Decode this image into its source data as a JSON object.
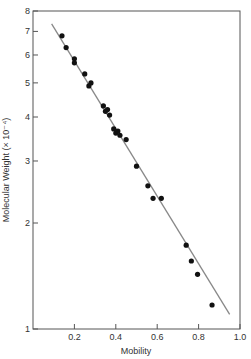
{
  "chart_data": {
    "type": "scatter",
    "title": "",
    "xlabel": "Mobility",
    "ylabel": "Molecular Weight (× 10⁻⁴)",
    "xlim": [
      0.0,
      1.0
    ],
    "ylim": [
      1,
      8
    ],
    "yscale": "log",
    "grid": false,
    "legend": null,
    "x_ticks": [
      0.2,
      0.4,
      0.6,
      0.8,
      1.0
    ],
    "x_tick_labels": [
      "0.2",
      "0.4",
      "0.6",
      "0.8",
      "1.0"
    ],
    "y_ticks": [
      1,
      2,
      3,
      4,
      5,
      6,
      7,
      8
    ],
    "y_tick_labels": [
      "1",
      "2",
      "3",
      "4",
      "5",
      "6",
      "7",
      "8"
    ],
    "series": [
      {
        "name": "Proteins",
        "kind": "points",
        "x": [
          0.14,
          0.16,
          0.2,
          0.2,
          0.25,
          0.27,
          0.28,
          0.34,
          0.35,
          0.36,
          0.37,
          0.39,
          0.4,
          0.41,
          0.42,
          0.45,
          0.5,
          0.555,
          0.58,
          0.62,
          0.74,
          0.765,
          0.795,
          0.865
        ],
        "y": [
          6.8,
          6.3,
          5.85,
          5.7,
          5.3,
          4.9,
          5.0,
          4.3,
          4.15,
          4.2,
          4.05,
          3.7,
          3.6,
          3.65,
          3.55,
          3.45,
          2.9,
          2.55,
          2.35,
          2.35,
          1.73,
          1.56,
          1.43,
          1.17
        ]
      },
      {
        "name": "Fit line",
        "kind": "line",
        "x": [
          0.09,
          0.95
        ],
        "y": [
          7.35,
          1.1
        ]
      }
    ],
    "colors": {
      "points": "#111111",
      "line": "#888888",
      "axes": "#555555",
      "text": "#333333"
    }
  }
}
